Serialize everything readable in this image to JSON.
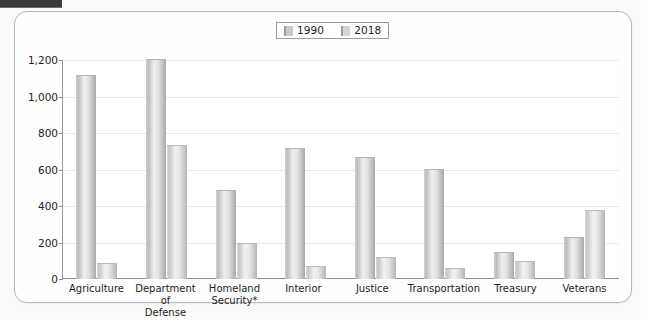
{
  "banner": {
    "fragment_name": "cropped-header-band"
  },
  "legend": {
    "position": "top-center",
    "entries": [
      {
        "label": "1990",
        "color": "#c9c9c9"
      },
      {
        "label": "2018",
        "color": "#d5d5d5"
      }
    ]
  },
  "axes": {
    "y_title": "Thousands",
    "y_ticks": [
      "0",
      "200",
      "400",
      "600",
      "800",
      "1,000",
      "1,200"
    ]
  },
  "chart_data": {
    "type": "bar",
    "title": "",
    "subtitle": "",
    "xlabel": "",
    "ylabel": "Thousands",
    "ylim": [
      0,
      1200
    ],
    "ytick_step": 200,
    "grid": true,
    "legend_position": "top-center",
    "categories": [
      "Agriculture",
      "Department of Defense",
      "Homeland Security*",
      "Interior",
      "Justice",
      "Transportation",
      "Treasury",
      "Veterans"
    ],
    "category_lines": [
      [
        "Agriculture"
      ],
      [
        "Department of",
        "Defense"
      ],
      [
        "Homeland",
        "Security*"
      ],
      [
        "Interior"
      ],
      [
        "Justice"
      ],
      [
        "Transportation"
      ],
      [
        "Treasury"
      ],
      [
        "Veterans"
      ]
    ],
    "series": [
      {
        "name": "1990",
        "color": "#c9c9c9",
        "values": [
          1110,
          1200,
          480,
          715,
          665,
          600,
          140,
          225
        ]
      },
      {
        "name": "2018",
        "color": "#d5d5d5",
        "values": [
          80,
          730,
          190,
          65,
          115,
          55,
          95,
          375
        ]
      }
    ],
    "annotations": [
      "* Homeland Security values marked with asterisk"
    ]
  }
}
